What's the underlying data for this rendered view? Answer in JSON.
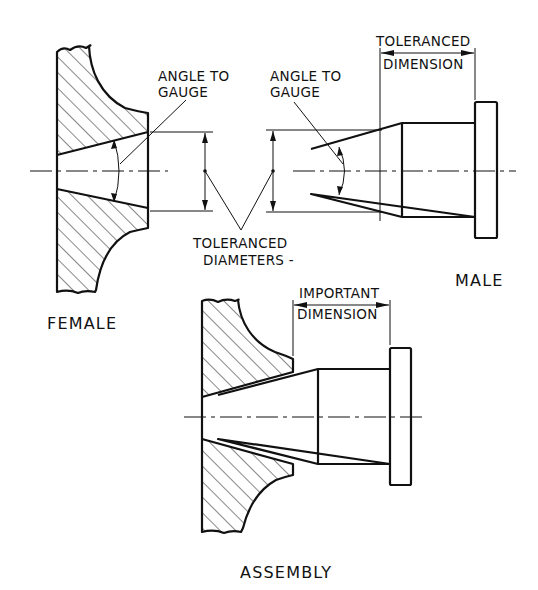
{
  "figure": {
    "type": "engineering drawing - taper fit gauging",
    "colors": {
      "line": "#111111",
      "background": "#ffffff"
    }
  },
  "labels": {
    "female_angle": [
      "ANGLE TO",
      "GAUGE"
    ],
    "male_angle": [
      "ANGLE TO",
      "GAUGE"
    ],
    "male_dimension": [
      "TOLERANCED",
      "DIMENSION"
    ],
    "diameters": [
      "TOLERANCED",
      "DIAMETERS -"
    ],
    "assembly_dimension": [
      "IMPORTANT",
      "DIMENSION"
    ],
    "female_caption": "FEMALE",
    "male_caption": "MALE",
    "assembly_caption": "ASSEMBLY"
  },
  "views": [
    {
      "name": "female",
      "description": "Hatched section of female tapered bore"
    },
    {
      "name": "male",
      "description": "Male tapered plug with flange"
    },
    {
      "name": "assembly",
      "description": "Male plug seated in female bore"
    }
  ]
}
